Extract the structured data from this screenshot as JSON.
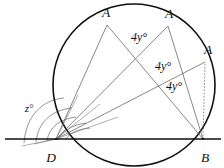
{
  "figure": {
    "type": "geometry-diagram",
    "background_color": "#ffffff",
    "stroke_color": "#111111",
    "construction_color": "#555555",
    "width": 224,
    "height": 168,
    "vertices": [
      {
        "id": "A1",
        "label": "A",
        "x": 107,
        "y": 25,
        "label_x": 106,
        "label_y": 13
      },
      {
        "id": "A2",
        "label": "A",
        "x": 168,
        "y": 26,
        "label_x": 169,
        "label_y": 14
      },
      {
        "id": "A3",
        "label": "A",
        "x": 205,
        "y": 62,
        "label_x": 208,
        "label_y": 50
      },
      {
        "id": "D",
        "label": "D",
        "x": 56,
        "y": 139,
        "label_x": 51,
        "label_y": 158
      },
      {
        "id": "B",
        "label": "B",
        "x": 203,
        "y": 139,
        "label_x": 205,
        "label_y": 158
      }
    ],
    "angle_labels": [
      {
        "id": "angle1",
        "text": "4y°",
        "x": 139,
        "y": 37
      },
      {
        "id": "angle2",
        "text": "4y°",
        "x": 163,
        "y": 66
      },
      {
        "id": "angle3",
        "text": "4y°",
        "x": 174,
        "y": 86
      },
      {
        "id": "angle4",
        "text": "z°",
        "x": 29,
        "y": 108
      }
    ],
    "circle": {
      "center_x": 134,
      "center_y": 85,
      "radius": 81
    },
    "baseline": {
      "x1": 5,
      "y1": 139,
      "x2": 221,
      "y2": 139
    }
  }
}
